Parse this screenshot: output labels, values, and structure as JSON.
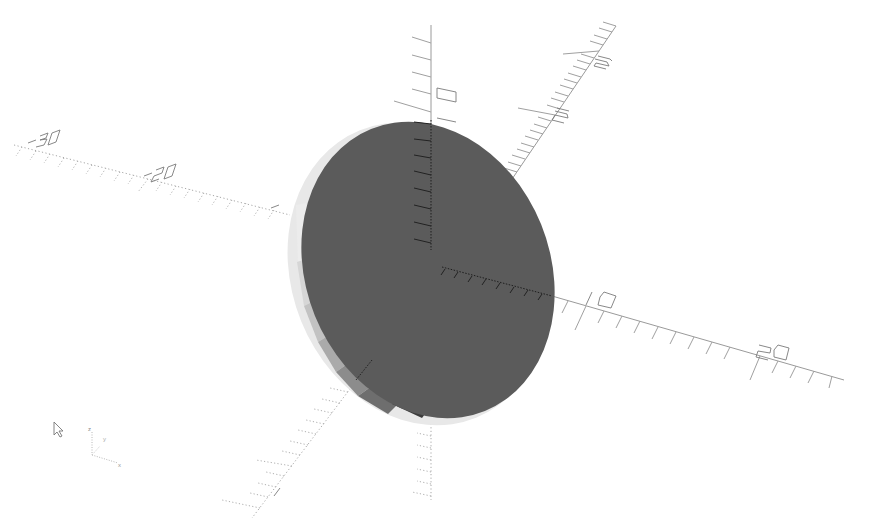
{
  "viewport": {
    "background": "#ffffff",
    "object": {
      "shape": "cylinder-disk",
      "face_color": "#5a5a5a",
      "rim_colors": [
        "#e6e6e6",
        "#d2d2d2",
        "#bdbdbd",
        "#a5a5a5",
        "#8a8a8a",
        "#6e6e6e",
        "#3e3e3e"
      ]
    },
    "axes": {
      "x_positive_labels": [
        "10",
        "20"
      ],
      "x_negative_labels": [
        "-20",
        "-30"
      ],
      "y_positive_labels": [
        "10",
        "20",
        "30"
      ],
      "y_negative_labels": [
        "0"
      ],
      "z_positive_labels": [
        "10"
      ],
      "z_negative_labels": []
    },
    "axis_color": "#9a9a9a"
  },
  "orientation_gizmo": {
    "z_label": "z",
    "y_label": "y",
    "x_label": "x"
  },
  "cursor": {
    "icon": "mouse-pointer-icon"
  }
}
